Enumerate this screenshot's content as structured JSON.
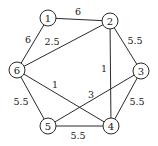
{
  "graph": {
    "type": "weighted-undirected-graph",
    "colors": {
      "stroke": "#2a2a2a",
      "text": "#222222",
      "background": "#ffffff"
    },
    "nodes": [
      {
        "id": "1",
        "label": "1",
        "x": 48,
        "y": 18
      },
      {
        "id": "2",
        "label": "2",
        "x": 110,
        "y": 21
      },
      {
        "id": "3",
        "label": "3",
        "x": 141,
        "y": 71
      },
      {
        "id": "4",
        "label": "4",
        "x": 111,
        "y": 126
      },
      {
        "id": "5",
        "label": "5",
        "x": 48,
        "y": 126
      },
      {
        "id": "6",
        "label": "6",
        "x": 17,
        "y": 70
      }
    ],
    "edges": [
      {
        "from": "1",
        "to": "2",
        "weight": "6",
        "label_x": 78,
        "label_y": 11
      },
      {
        "from": "1",
        "to": "6",
        "weight": "6",
        "label_x": 28,
        "label_y": 39
      },
      {
        "from": "6",
        "to": "2",
        "weight": "2.5",
        "label_x": 52,
        "label_y": 41
      },
      {
        "from": "2",
        "to": "3",
        "weight": "5.5",
        "label_x": 135,
        "label_y": 40
      },
      {
        "from": "2",
        "to": "4",
        "weight": "1",
        "label_x": 104,
        "label_y": 68
      },
      {
        "from": "6",
        "to": "4",
        "weight": "1",
        "label_x": 55,
        "label_y": 84
      },
      {
        "from": "5",
        "to": "3",
        "weight": "3",
        "label_x": 91,
        "label_y": 94
      },
      {
        "from": "6",
        "to": "5",
        "weight": "5.5",
        "label_x": 21,
        "label_y": 101
      },
      {
        "from": "3",
        "to": "4",
        "weight": "5.5",
        "label_x": 137,
        "label_y": 101
      },
      {
        "from": "5",
        "to": "4",
        "weight": "5.5",
        "label_x": 78,
        "label_y": 135
      }
    ],
    "node_radius": 8
  }
}
